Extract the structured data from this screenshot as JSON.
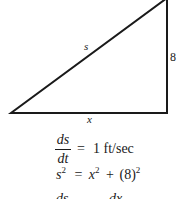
{
  "diagram": {
    "type": "right-triangle",
    "stroke_color": "#1a1a1a",
    "vertices": {
      "bottom_left": [
        11,
        113
      ],
      "bottom_right": [
        167,
        113
      ],
      "top_right": [
        167,
        -2
      ]
    },
    "labels": {
      "hypotenuse": "s",
      "vertical_leg": "8",
      "horizontal_leg": "x"
    }
  },
  "equations": {
    "rate": {
      "numerator": "ds",
      "denominator": "dt",
      "equals": "=",
      "value": "1 ft/sec"
    },
    "pythagorean": {
      "lhs_var": "s",
      "lhs_exp": "2",
      "equals": "=",
      "term1_var": "x",
      "term1_exp": "2",
      "plus": "+",
      "term2": "(8)",
      "term2_exp": "2"
    },
    "partial_next_line": {
      "left": "ds",
      "right": "dx"
    }
  }
}
